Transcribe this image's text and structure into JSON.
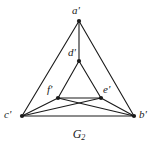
{
  "figure": {
    "caption_base": "G",
    "caption_sub": "2",
    "caption_full": "G2",
    "background_color": "#ffffff",
    "stroke_color": "#1a1a1a",
    "vertex_color": "#1a1a1a",
    "stroke_width": 1.1,
    "vertex_radius": 2.1,
    "width": 158,
    "height": 148
  },
  "graph_data": {
    "type": "node-link-diagram",
    "directed": false,
    "vertices": [
      {
        "id": "a",
        "label": "a'",
        "x": 79,
        "y": 21,
        "label_x": 72,
        "label_y": 5
      },
      {
        "id": "d",
        "label": "d'",
        "x": 79,
        "y": 61,
        "label_x": 68,
        "label_y": 47
      },
      {
        "id": "f",
        "label": "f'",
        "x": 58,
        "y": 98,
        "label_x": 47,
        "label_y": 84
      },
      {
        "id": "e",
        "label": "e'",
        "x": 101,
        "y": 98,
        "label_x": 103,
        "label_y": 84
      },
      {
        "id": "c",
        "label": "c'",
        "x": 22,
        "y": 116,
        "label_x": 4,
        "label_y": 109
      },
      {
        "id": "b",
        "label": "b'",
        "x": 134,
        "y": 116,
        "label_x": 139,
        "label_y": 109
      }
    ],
    "edges": [
      {
        "source": "a",
        "target": "c",
        "name": "edge-a-c"
      },
      {
        "source": "a",
        "target": "b",
        "name": "edge-a-b"
      },
      {
        "source": "a",
        "target": "d",
        "name": "edge-a-d"
      },
      {
        "source": "d",
        "target": "f",
        "name": "edge-d-f"
      },
      {
        "source": "d",
        "target": "e",
        "name": "edge-d-e"
      },
      {
        "source": "f",
        "target": "e",
        "name": "edge-f-e"
      },
      {
        "source": "c",
        "target": "f",
        "name": "edge-c-f"
      },
      {
        "source": "b",
        "target": "e",
        "name": "edge-b-e"
      },
      {
        "source": "c",
        "target": "e",
        "name": "edge-c-e"
      },
      {
        "source": "b",
        "target": "f",
        "name": "edge-b-f"
      },
      {
        "source": "c",
        "target": "b",
        "name": "edge-c-b"
      }
    ]
  }
}
